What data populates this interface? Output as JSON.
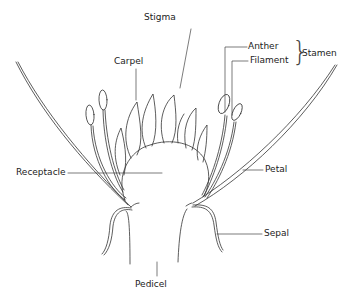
{
  "diagram": {
    "labels": {
      "stigma": "Stigma",
      "carpel": "Carpel",
      "anther": "Anther",
      "filament": "Filament",
      "stamen": "Stamen",
      "receptacle": "Receptacle",
      "petal": "Petal",
      "sepal": "Sepal",
      "pedicel": "Pedicel"
    },
    "brace": "}",
    "colors": {
      "line": "#333333",
      "text": "#222222",
      "background": "#ffffff"
    }
  }
}
